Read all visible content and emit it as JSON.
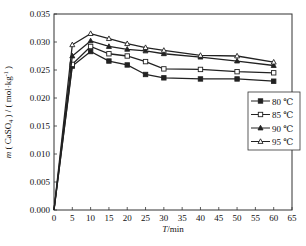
{
  "chart_data": {
    "type": "line",
    "title": "",
    "xlabel": "T/min",
    "xlabel_italic_part": "T",
    "xlabel_rest": "/min",
    "ylabel": "m ( CaSO4 ) / ( mol·kg⁻¹ )",
    "ylabel_parts": {
      "m": "m",
      "open": " ( CaSO",
      "sub": "4",
      "mid": " ) / ( mol·kg",
      "sup": "-1",
      "close": " )"
    },
    "xlim": [
      0,
      65
    ],
    "ylim": [
      0.0,
      0.035
    ],
    "xticks": [
      0,
      5,
      10,
      15,
      20,
      25,
      30,
      35,
      40,
      45,
      50,
      55,
      60,
      65
    ],
    "xtick_labels": [
      "0",
      "5",
      "10",
      "15",
      "20",
      "25",
      "30",
      "35",
      "40",
      "45",
      "50",
      "55",
      "60",
      "65"
    ],
    "yticks": [
      0.0,
      0.005,
      0.01,
      0.015,
      0.02,
      0.025,
      0.03,
      0.035
    ],
    "ytick_labels": [
      "0.000",
      "0.005",
      "0.010",
      "0.015",
      "0.020",
      "0.025",
      "0.030",
      "0.035"
    ],
    "grid": false,
    "legend_position": "center-right",
    "x": [
      0,
      5,
      10,
      15,
      20,
      25,
      30,
      40,
      50,
      60
    ],
    "series": [
      {
        "name": "80 ℃",
        "marker": "square",
        "values": [
          0.0,
          0.0257,
          0.0283,
          0.0266,
          0.0259,
          0.0242,
          0.0236,
          0.0234,
          0.0234,
          0.023
        ]
      },
      {
        "name": "85 ℃",
        "marker": "open-square",
        "values": [
          0.0,
          0.026,
          0.0292,
          0.0279,
          0.0275,
          0.0265,
          0.0252,
          0.0251,
          0.0247,
          0.0245
        ]
      },
      {
        "name": "90 ℃",
        "marker": "triangle",
        "values": [
          0.0,
          0.0275,
          0.0302,
          0.0292,
          0.0287,
          0.0284,
          0.0279,
          0.0273,
          0.0266,
          0.0258
        ]
      },
      {
        "name": "95 ℃",
        "marker": "open-triangle",
        "values": [
          0.0,
          0.0295,
          0.0315,
          0.0306,
          0.0297,
          0.029,
          0.0285,
          0.0276,
          0.0275,
          0.0264
        ]
      }
    ],
    "colors": {
      "line": "#222222",
      "axis": "#333333",
      "background": "#ffffff"
    }
  }
}
